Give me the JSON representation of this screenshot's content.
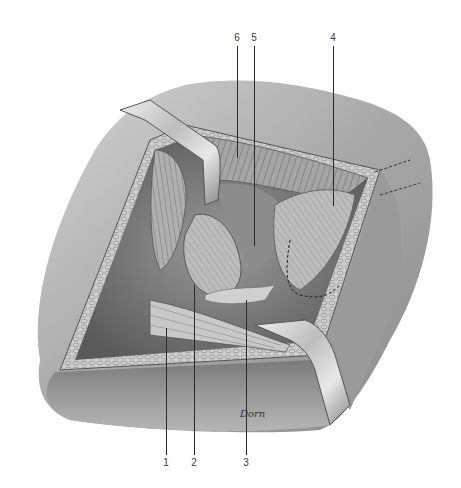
{
  "figure": {
    "style": "grayscale pencil illustration",
    "artist_signature": "Dorn",
    "labels": [
      {
        "number": "1",
        "x": 166,
        "y": 463,
        "line_top": 328,
        "line_bottom": 455,
        "position": "bottom"
      },
      {
        "number": "2",
        "x": 194,
        "y": 463,
        "line_top": 285,
        "line_bottom": 455,
        "position": "bottom"
      },
      {
        "number": "3",
        "x": 246,
        "y": 463,
        "line_top": 300,
        "line_bottom": 455,
        "position": "bottom"
      },
      {
        "number": "4",
        "x": 333,
        "y": 38,
        "line_top": 46,
        "line_bottom": 206,
        "position": "top"
      },
      {
        "number": "5",
        "x": 254,
        "y": 38,
        "line_top": 46,
        "line_bottom": 246,
        "position": "top"
      },
      {
        "number": "6",
        "x": 237,
        "y": 38,
        "line_top": 46,
        "line_bottom": 158,
        "position": "top"
      }
    ]
  },
  "colors": {
    "background": "#ffffff",
    "skin": "#b9b9b9",
    "skin_dark": "#8a8a8a",
    "fat": "#cfcfcf",
    "muscle": "#9d9d9d",
    "deep": "#6e6e6e",
    "retractor": "#d8d8d8",
    "line": "#2a2a2a"
  }
}
